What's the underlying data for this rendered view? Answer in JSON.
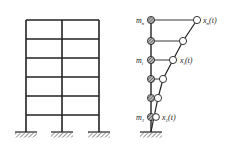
{
  "diagram": {
    "type": "structural-dynamics-model",
    "left_figure": {
      "description": "multi-storey two-bay frame",
      "storeys": 5,
      "bays": 2,
      "supports": 3
    },
    "right_figure": {
      "description": "lumped-mass cantilever model with displaced shape",
      "masses": 6,
      "labels": {
        "top_mass": "m",
        "top_mass_sub": "n",
        "top_disp": "x",
        "top_disp_sub": "n",
        "top_disp_arg": "(t)",
        "mid_mass": "m",
        "mid_mass_sub": "i",
        "mid_disp": "x",
        "mid_disp_sub": "i",
        "mid_disp_arg": "(t)",
        "bottom_mass": "m",
        "bottom_mass_sub": "1",
        "bottom_disp": "x",
        "bottom_disp_sub": "1",
        "bottom_disp_arg": "(t)"
      }
    },
    "colors": {
      "line": "#222222",
      "hatch": "#444444"
    }
  }
}
